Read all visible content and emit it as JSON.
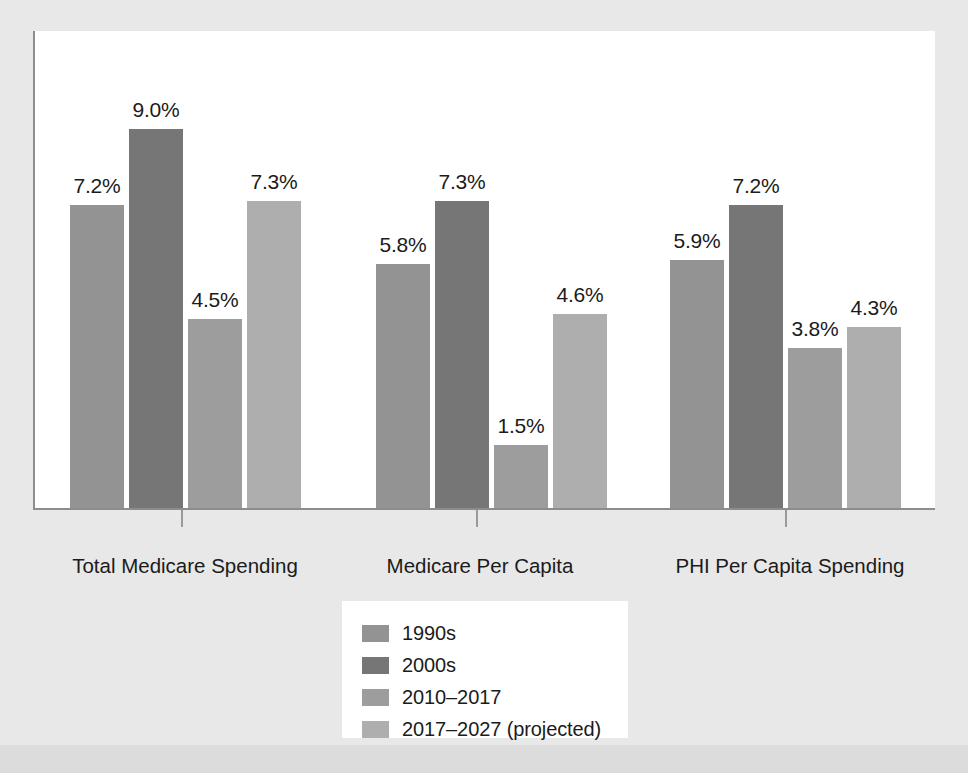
{
  "chart_data": {
    "type": "bar",
    "title": "",
    "subtitle": "",
    "xlabel": "",
    "ylabel": "",
    "ylim": [
      0,
      11.0
    ],
    "grid": false,
    "legend_position": "bottom-center",
    "categories": [
      "Total Medicare Spending",
      "Medicare Per Capita\nSpending",
      "PHI Per Capita Spending"
    ],
    "series": [
      {
        "name": "1990s",
        "color": "#939393",
        "values": [
          7.2,
          5.8,
          5.9
        ],
        "labels": [
          "7.2%",
          "5.8%",
          "5.9%"
        ]
      },
      {
        "name": "2000s",
        "color": "#767676",
        "values": [
          9.0,
          7.3,
          7.2
        ],
        "labels": [
          "9.0%",
          "7.3%",
          "7.2%"
        ]
      },
      {
        "name": "2010–2017",
        "color": "#9d9d9d",
        "values": [
          4.5,
          1.5,
          3.8
        ],
        "labels": [
          "4.5%",
          "1.5%",
          "3.8%"
        ]
      },
      {
        "name": "2017–2027 (projected)",
        "color": "#aeaeae",
        "values": [
          7.3,
          4.6,
          4.3
        ],
        "labels": [
          "7.3%",
          "4.6%",
          "4.3%"
        ]
      }
    ],
    "value_suffix": "%"
  },
  "legend": {
    "items": [
      {
        "label": "1990s",
        "color": "#939393"
      },
      {
        "label": "2000s",
        "color": "#767676"
      },
      {
        "label": "2010–2017",
        "color": "#9d9d9d"
      },
      {
        "label": "2017–2027 (projected)",
        "color": "#aeaeae"
      }
    ]
  },
  "axis": {
    "categories": [
      {
        "line1": "Total Medicare Spending",
        "line2": ""
      },
      {
        "line1": "Medicare Per Capita",
        "line2": "Spending"
      },
      {
        "line1": "PHI Per Capita Spending",
        "line2": ""
      }
    ]
  },
  "bars": [
    {
      "label": "7.2%",
      "series": "1990s",
      "group": "Total Medicare Spending"
    },
    {
      "label": "9.0%",
      "series": "2000s",
      "group": "Total Medicare Spending"
    },
    {
      "label": "4.5%",
      "series": "2010–2017",
      "group": "Total Medicare Spending"
    },
    {
      "label": "7.3%",
      "series": "2017–2027 (projected)",
      "group": "Total Medicare Spending"
    },
    {
      "label": "5.8%",
      "series": "1990s",
      "group": "Medicare Per Capita Spending"
    },
    {
      "label": "7.3%",
      "series": "2000s",
      "group": "Medicare Per Capita Spending"
    },
    {
      "label": "1.5%",
      "series": "2010–2017",
      "group": "Medicare Per Capita Spending"
    },
    {
      "label": "4.6%",
      "series": "2017–2027 (projected)",
      "group": "Medicare Per Capita Spending"
    },
    {
      "label": "5.9%",
      "series": "1990s",
      "group": "PHI Per Capita Spending"
    },
    {
      "label": "7.2%",
      "series": "2000s",
      "group": "PHI Per Capita Spending"
    },
    {
      "label": "3.8%",
      "series": "2010–2017",
      "group": "PHI Per Capita Spending"
    },
    {
      "label": "4.3%",
      "series": "2017–2027 (projected)",
      "group": "PHI Per Capita Spending"
    }
  ],
  "colors": {
    "page_background": "#dedede",
    "mat": "#e8e8e8",
    "plot_background": "#ffffff",
    "axis": "#8d8d8d",
    "text": "#1b1b1b"
  }
}
